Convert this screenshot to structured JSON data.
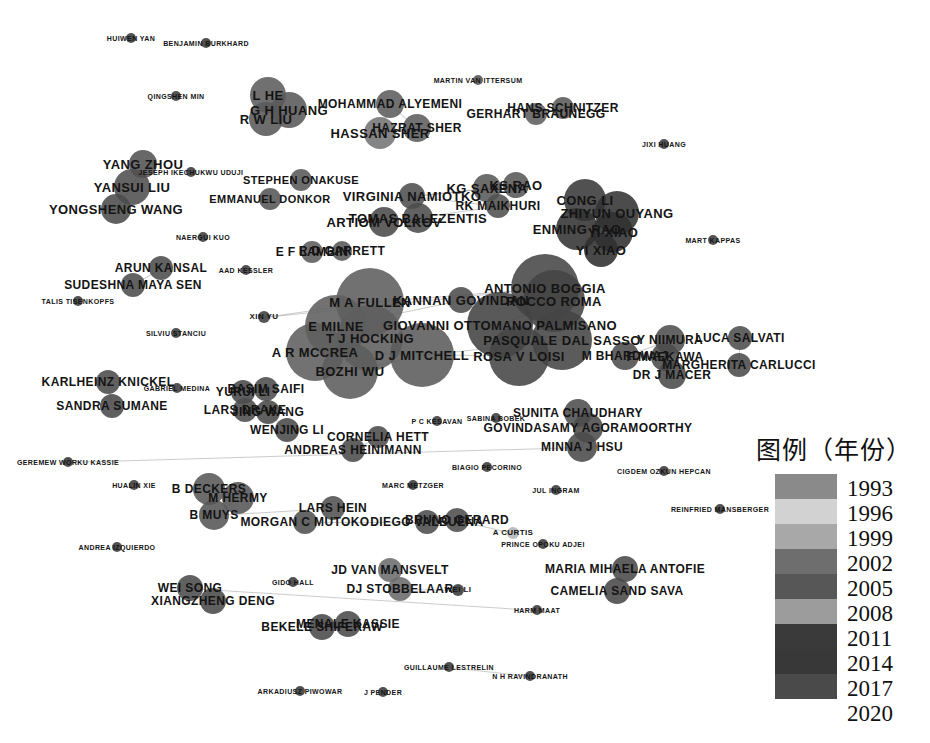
{
  "chart_data": {
    "type": "scatter",
    "title": "",
    "subtitle": "",
    "xlabel": "",
    "ylabel": "",
    "legend_position": "right",
    "grid": false,
    "legend": {
      "title": "图例（年份）",
      "years": [
        "1993",
        "1996",
        "1999",
        "2002",
        "2005",
        "2008",
        "2011",
        "2014",
        "2017",
        "2020"
      ],
      "swatches": [
        "#8a8a8a",
        "#d2d2d2",
        "#a8a8a8",
        "#6e6e6e",
        "#575757",
        "#9c9c9c",
        "#3a3a3a",
        "#383838",
        "#4a4a4a"
      ]
    },
    "nodes": [
      {
        "label": "HUIWEN YAN",
        "x": 131,
        "y": 38,
        "r": 5,
        "c": "#3c3c3c",
        "fs": 7
      },
      {
        "label": "BENJAMIN BURKHARD",
        "x": 206,
        "y": 43,
        "r": 5,
        "c": "#3a3a3a",
        "fs": 7
      },
      {
        "label": "MARTIN VAN ITTERSUM",
        "x": 478,
        "y": 80,
        "r": 5,
        "c": "#565656",
        "fs": 7
      },
      {
        "label": "QINGSHEN MIN",
        "x": 176,
        "y": 96,
        "r": 5,
        "c": "#3d3d3d",
        "fs": 7
      },
      {
        "label": "L HE",
        "x": 268,
        "y": 95,
        "r": 18,
        "c": "#5d5d5d",
        "fs": 13
      },
      {
        "label": "G H HUANG",
        "x": 289,
        "y": 110,
        "r": 18,
        "c": "#5a5a5a",
        "fs": 13
      },
      {
        "label": "R W LIU",
        "x": 266,
        "y": 119,
        "r": 17,
        "c": "#5a5a5a",
        "fs": 13
      },
      {
        "label": "MOHAMMAD ALYEMENI",
        "x": 390,
        "y": 104,
        "r": 14,
        "c": "#5e5e5e",
        "fs": 12
      },
      {
        "label": "HASSAN SHER",
        "x": 380,
        "y": 133,
        "r": 16,
        "c": "#757575",
        "fs": 13
      },
      {
        "label": "HAZRAT SHER",
        "x": 417,
        "y": 128,
        "r": 14,
        "c": "#5e5e5e",
        "fs": 12
      },
      {
        "label": "GERHART BRAUNEGG",
        "x": 536,
        "y": 114,
        "r": 11,
        "c": "#5f5f5f",
        "fs": 12
      },
      {
        "label": "HANS SCHNITZER",
        "x": 563,
        "y": 108,
        "r": 11,
        "c": "#5a5a5a",
        "fs": 12
      },
      {
        "label": "JIXI HUANG",
        "x": 664,
        "y": 144,
        "r": 5,
        "c": "#3b3b3b",
        "fs": 7
      },
      {
        "label": "YANG ZHOU",
        "x": 143,
        "y": 164,
        "r": 14,
        "c": "#545454",
        "fs": 13
      },
      {
        "label": "YANSUI LIU",
        "x": 132,
        "y": 187,
        "r": 18,
        "c": "#4f4f4f",
        "fs": 13
      },
      {
        "label": "YONGSHENG WANG",
        "x": 116,
        "y": 209,
        "r": 15,
        "c": "#4c4c4c",
        "fs": 13
      },
      {
        "label": "JESEPH IKECHUKWU UDUJI",
        "x": 191,
        "y": 172,
        "r": 5,
        "c": "#3b3b3b",
        "fs": 7
      },
      {
        "label": "STEPHEN ONAKUSE",
        "x": 301,
        "y": 180,
        "r": 11,
        "c": "#5a5a5a",
        "fs": 11
      },
      {
        "label": "EMMANUEL DONKOR",
        "x": 270,
        "y": 199,
        "r": 11,
        "c": "#565656",
        "fs": 11
      },
      {
        "label": "VIRGINIA NAMIOTKO",
        "x": 412,
        "y": 196,
        "r": 13,
        "c": "#4f4f4f",
        "fs": 13
      },
      {
        "label": "KG SAXENA",
        "x": 487,
        "y": 188,
        "r": 14,
        "c": "#5a5a5a",
        "fs": 13
      },
      {
        "label": "KS RAO",
        "x": 516,
        "y": 185,
        "r": 13,
        "c": "#585858",
        "fs": 13
      },
      {
        "label": "RK MAIKHURI",
        "x": 498,
        "y": 206,
        "r": 12,
        "c": "#505050",
        "fs": 12
      },
      {
        "label": "ARTIOM VOLKOV",
        "x": 384,
        "y": 222,
        "r": 15,
        "c": "#4b4b4b",
        "fs": 13
      },
      {
        "label": "TOMAS BALEZENTIS",
        "x": 418,
        "y": 218,
        "r": 15,
        "c": "#4d4d4d",
        "fs": 13
      },
      {
        "label": "CONG LI",
        "x": 585,
        "y": 200,
        "r": 21,
        "c": "#3a3a3a",
        "fs": 13
      },
      {
        "label": "ZHIYUN OUYANG",
        "x": 617,
        "y": 213,
        "r": 22,
        "c": "#343434",
        "fs": 13
      },
      {
        "label": "ENMING RAO",
        "x": 577,
        "y": 229,
        "r": 21,
        "c": "#343434",
        "fs": 13
      },
      {
        "label": "YI XIAO",
        "x": 613,
        "y": 232,
        "r": 20,
        "c": "#313131",
        "fs": 13
      },
      {
        "label": "YI XIAO",
        "x": 601,
        "y": 250,
        "r": 17,
        "c": "#2f2f2f",
        "fs": 13
      },
      {
        "label": "MART KAPPAS",
        "x": 713,
        "y": 240,
        "r": 5,
        "c": "#3d3d3d",
        "fs": 7
      },
      {
        "label": "NAERGUI KUO",
        "x": 203,
        "y": 237,
        "r": 5,
        "c": "#3d3d3d",
        "fs": 7
      },
      {
        "label": "E F LAMBIN",
        "x": 312,
        "y": 252,
        "r": 11,
        "c": "#5d5d5d",
        "fs": 12
      },
      {
        "label": "R D GARRETT",
        "x": 342,
        "y": 251,
        "r": 10,
        "c": "#5a5a5a",
        "fs": 12
      },
      {
        "label": "AAD KESSLER",
        "x": 246,
        "y": 270,
        "r": 5,
        "c": "#3d3d3d",
        "fs": 7
      },
      {
        "label": "ARUN KANSAL",
        "x": 161,
        "y": 268,
        "r": 12,
        "c": "#4d4d4d",
        "fs": 12
      },
      {
        "label": "SUDESHNA MAYA SEN",
        "x": 133,
        "y": 285,
        "r": 12,
        "c": "#4d4d4d",
        "fs": 12
      },
      {
        "label": "TALIS TISENKOPFS",
        "x": 78,
        "y": 301,
        "r": 5,
        "c": "#3b3b3b",
        "fs": 7
      },
      {
        "label": "SILVIU STANCIU",
        "x": 176,
        "y": 333,
        "r": 5,
        "c": "#3b3b3b",
        "fs": 7
      },
      {
        "label": "XIN YU",
        "x": 264,
        "y": 317,
        "r": 6,
        "c": "#3f3f3f",
        "fs": 8
      },
      {
        "label": "ANTONIO BOGGIA",
        "x": 545,
        "y": 288,
        "r": 34,
        "c": "#474747",
        "fs": 13
      },
      {
        "label": "M A FULLEN",
        "x": 370,
        "y": 302,
        "r": 34,
        "c": "#5e5e5e",
        "fs": 13
      },
      {
        "label": "KANNAN GOVINDAN",
        "x": 461,
        "y": 300,
        "r": 13,
        "c": "#4e4e4e",
        "fs": 13
      },
      {
        "label": "ROCCO ROMA",
        "x": 554,
        "y": 301,
        "r": 31,
        "c": "#454545",
        "fs": 13
      },
      {
        "label": "E MILNE",
        "x": 336,
        "y": 326,
        "r": 31,
        "c": "#5f5f5f",
        "fs": 13
      },
      {
        "label": "GIOVANNI OTTOMANO PALMISANO",
        "x": 500,
        "y": 325,
        "r": 33,
        "c": "#434343",
        "fs": 13
      },
      {
        "label": "T J HOCKING",
        "x": 370,
        "y": 338,
        "r": 33,
        "c": "#5e5e5e",
        "fs": 13
      },
      {
        "label": "PASQUALE DAL SASSO",
        "x": 562,
        "y": 340,
        "r": 30,
        "c": "#454545",
        "fs": 13
      },
      {
        "label": "A R MCCREA",
        "x": 315,
        "y": 352,
        "r": 29,
        "c": "#5f5f5f",
        "fs": 13
      },
      {
        "label": "D J MITCHELL",
        "x": 422,
        "y": 355,
        "r": 32,
        "c": "#5c5c5c",
        "fs": 13
      },
      {
        "label": "ROSA V LOISI",
        "x": 519,
        "y": 356,
        "r": 30,
        "c": "#464646",
        "fs": 13
      },
      {
        "label": "BOZHI WU",
        "x": 350,
        "y": 371,
        "r": 28,
        "c": "#5d5d5d",
        "fs": 13
      },
      {
        "label": "Y NIIMURA",
        "x": 670,
        "y": 340,
        "r": 15,
        "c": "#4f4f4f",
        "fs": 12
      },
      {
        "label": "M BHARDWAJ",
        "x": 625,
        "y": 356,
        "r": 14,
        "c": "#4d4d4d",
        "fs": 12
      },
      {
        "label": "F MAEKAWA",
        "x": 665,
        "y": 357,
        "r": 14,
        "c": "#4b4b4b",
        "fs": 12
      },
      {
        "label": "DR J MACER",
        "x": 672,
        "y": 375,
        "r": 14,
        "c": "#4b4b4b",
        "fs": 12
      },
      {
        "label": "LUCA SALVATI",
        "x": 740,
        "y": 338,
        "r": 12,
        "c": "#4e4e4e",
        "fs": 12
      },
      {
        "label": "MARGHERITA CARLUCCI",
        "x": 739,
        "y": 365,
        "r": 12,
        "c": "#4c4c4c",
        "fs": 12
      },
      {
        "label": "KARLHEINZ KNICKEL",
        "x": 108,
        "y": 382,
        "r": 12,
        "c": "#4c4c4c",
        "fs": 12
      },
      {
        "label": "GABRIEL MEDINA",
        "x": 177,
        "y": 388,
        "r": 5,
        "c": "#3c3c3c",
        "fs": 7
      },
      {
        "label": "SANDRA SUMANE",
        "x": 112,
        "y": 406,
        "r": 12,
        "c": "#4b4b4b",
        "fs": 12
      },
      {
        "label": "YURUI LI",
        "x": 243,
        "y": 392,
        "r": 12,
        "c": "#4a4a4a",
        "fs": 12
      },
      {
        "label": "BASIM SAIFI",
        "x": 266,
        "y": 389,
        "r": 12,
        "c": "#4d4d4d",
        "fs": 12
      },
      {
        "label": "LARS DRAKE",
        "x": 245,
        "y": 410,
        "r": 12,
        "c": "#4d4d4d",
        "fs": 12
      },
      {
        "label": "JING WANG",
        "x": 268,
        "y": 412,
        "r": 12,
        "c": "#4a4a4a",
        "fs": 12
      },
      {
        "label": "WENJING LI",
        "x": 287,
        "y": 430,
        "r": 12,
        "c": "#4a4a4a",
        "fs": 12
      },
      {
        "label": "ANDREAS HEINIMANN",
        "x": 353,
        "y": 450,
        "r": 12,
        "c": "#4c4c4c",
        "fs": 12
      },
      {
        "label": "CORNELIA HETT",
        "x": 378,
        "y": 437,
        "r": 11,
        "c": "#4c4c4c",
        "fs": 12
      },
      {
        "label": "P C KESAVAN",
        "x": 437,
        "y": 421,
        "r": 5,
        "c": "#3c3c3c",
        "fs": 7
      },
      {
        "label": "SABINA BOBEK",
        "x": 496,
        "y": 418,
        "r": 5,
        "c": "#3c3c3c",
        "fs": 7
      },
      {
        "label": "SUNITA CHAUDHARY",
        "x": 578,
        "y": 413,
        "r": 14,
        "c": "#4e4e4e",
        "fs": 12
      },
      {
        "label": "GOVINDASAMY AGORAMOORTHY",
        "x": 588,
        "y": 428,
        "r": 15,
        "c": "#4c4c4c",
        "fs": 12
      },
      {
        "label": "MINNA J HSU",
        "x": 582,
        "y": 447,
        "r": 15,
        "c": "#4b4b4b",
        "fs": 12
      },
      {
        "label": "GEREMEW WORKU KASSIE",
        "x": 68,
        "y": 462,
        "r": 5,
        "c": "#3a3a3a",
        "fs": 7
      },
      {
        "label": "BIAGIO PECORINO",
        "x": 487,
        "y": 467,
        "r": 5,
        "c": "#3b3b3b",
        "fs": 7
      },
      {
        "label": "CIGDEM OZKUN HEPCAN",
        "x": 664,
        "y": 471,
        "r": 5,
        "c": "#3b3b3b",
        "fs": 7
      },
      {
        "label": "MARC METZGER",
        "x": 413,
        "y": 485,
        "r": 5,
        "c": "#3b3b3b",
        "fs": 7
      },
      {
        "label": "JUL INGRAM",
        "x": 556,
        "y": 490,
        "r": 5,
        "c": "#3c3c3c",
        "fs": 7
      },
      {
        "label": "HUALIN XIE",
        "x": 134,
        "y": 485,
        "r": 5,
        "c": "#3b3b3b",
        "fs": 7
      },
      {
        "label": "B DECKERS",
        "x": 209,
        "y": 489,
        "r": 16,
        "c": "#585858",
        "fs": 12
      },
      {
        "label": "M HERMY",
        "x": 238,
        "y": 498,
        "r": 16,
        "c": "#565656",
        "fs": 12
      },
      {
        "label": "B MUYS",
        "x": 214,
        "y": 515,
        "r": 15,
        "c": "#565656",
        "fs": 12
      },
      {
        "label": "LARS HEIN",
        "x": 333,
        "y": 508,
        "r": 12,
        "c": "#525252",
        "fs": 12
      },
      {
        "label": "MORGAN C MUTOKO",
        "x": 305,
        "y": 522,
        "r": 12,
        "c": "#525252",
        "fs": 12
      },
      {
        "label": "DIEGO VALBUENA",
        "x": 427,
        "y": 522,
        "r": 12,
        "c": "#4d4d4d",
        "fs": 12
      },
      {
        "label": "BRUNO GERARD",
        "x": 457,
        "y": 520,
        "r": 12,
        "c": "#4e4e4e",
        "fs": 12
      },
      {
        "label": "A CURTIS",
        "x": 513,
        "y": 533,
        "r": 6,
        "c": "#b4b4b4",
        "fs": 8
      },
      {
        "label": "REINFRIED MANSBERGER",
        "x": 720,
        "y": 509,
        "r": 5,
        "c": "#3b3b3b",
        "fs": 7
      },
      {
        "label": "PRINCE OPOKU ADJEI",
        "x": 543,
        "y": 544,
        "r": 5,
        "c": "#3c3c3c",
        "fs": 7
      },
      {
        "label": "ANDREA IZQUIERDO",
        "x": 117,
        "y": 547,
        "r": 5,
        "c": "#3b3b3b",
        "fs": 7
      },
      {
        "label": "GIDO HALL",
        "x": 293,
        "y": 582,
        "r": 5,
        "c": "#3b3b3b",
        "fs": 7
      },
      {
        "label": "JD VAN MANSVELT",
        "x": 390,
        "y": 570,
        "r": 12,
        "c": "#6d6d6d",
        "fs": 12
      },
      {
        "label": "DJ STOBBELAAR",
        "x": 400,
        "y": 589,
        "r": 12,
        "c": "#6b6b6b",
        "fs": 12
      },
      {
        "label": "WEI LI",
        "x": 458,
        "y": 590,
        "r": 6,
        "c": "#3a3a3a",
        "fs": 8
      },
      {
        "label": "MARIA MIHAELA ANTOFIE",
        "x": 625,
        "y": 569,
        "r": 13,
        "c": "#4a4a4a",
        "fs": 12
      },
      {
        "label": "CAMELIA SAND SAVA",
        "x": 617,
        "y": 591,
        "r": 13,
        "c": "#484848",
        "fs": 12
      },
      {
        "label": "HARM MAAT",
        "x": 537,
        "y": 610,
        "r": 5,
        "c": "#3a3a3a",
        "fs": 7
      },
      {
        "label": "WEI SONG",
        "x": 190,
        "y": 588,
        "r": 13,
        "c": "#4c4c4c",
        "fs": 12
      },
      {
        "label": "XIANGZHENG DENG",
        "x": 213,
        "y": 601,
        "r": 13,
        "c": "#4a4a4a",
        "fs": 12
      },
      {
        "label": "BEKELE SHIFERAW",
        "x": 322,
        "y": 627,
        "r": 13,
        "c": "#4a4a4a",
        "fs": 12
      },
      {
        "label": "MENALE KASSIE",
        "x": 348,
        "y": 624,
        "r": 13,
        "c": "#4b4b4b",
        "fs": 12
      },
      {
        "label": "GUILLAUME LESTRELIN",
        "x": 449,
        "y": 667,
        "r": 5,
        "c": "#3a3a3a",
        "fs": 7
      },
      {
        "label": "N H RAVINDRANATH",
        "x": 530,
        "y": 676,
        "r": 5,
        "c": "#3a3a3a",
        "fs": 7
      },
      {
        "label": "ARKADIUSZ PIWOWAR",
        "x": 300,
        "y": 691,
        "r": 5,
        "c": "#3a3a3a",
        "fs": 7
      },
      {
        "label": "J PENDER",
        "x": 383,
        "y": 692,
        "r": 5,
        "c": "#3a3a3a",
        "fs": 7
      }
    ],
    "edges": [
      [
        4,
        5
      ],
      [
        4,
        6
      ],
      [
        5,
        6
      ],
      [
        7,
        8
      ],
      [
        7,
        9
      ],
      [
        8,
        9
      ],
      [
        10,
        11
      ],
      [
        13,
        14
      ],
      [
        14,
        15
      ],
      [
        19,
        20
      ],
      [
        19,
        21
      ],
      [
        20,
        21
      ],
      [
        19,
        22
      ],
      [
        22,
        23
      ],
      [
        25,
        26
      ],
      [
        25,
        27
      ],
      [
        26,
        27
      ],
      [
        26,
        28
      ],
      [
        27,
        28
      ],
      [
        32,
        33
      ],
      [
        35,
        36
      ],
      [
        39,
        40
      ],
      [
        39,
        41
      ],
      [
        40,
        41
      ],
      [
        42,
        43
      ],
      [
        42,
        44
      ],
      [
        43,
        45
      ],
      [
        44,
        46
      ],
      [
        45,
        47
      ],
      [
        46,
        48
      ],
      [
        47,
        49
      ],
      [
        48,
        50
      ],
      [
        49,
        51
      ],
      [
        52,
        53
      ],
      [
        53,
        54
      ],
      [
        54,
        55
      ],
      [
        56,
        57
      ],
      [
        58,
        60
      ],
      [
        61,
        62
      ],
      [
        61,
        63
      ],
      [
        62,
        64
      ],
      [
        63,
        64
      ],
      [
        64,
        65
      ],
      [
        66,
        67
      ],
      [
        71,
        72
      ],
      [
        72,
        73
      ],
      [
        80,
        81
      ],
      [
        81,
        82
      ],
      [
        83,
        84
      ],
      [
        85,
        86
      ],
      [
        92,
        93
      ],
      [
        96,
        97
      ],
      [
        99,
        100
      ],
      [
        101,
        102
      ]
    ]
  }
}
